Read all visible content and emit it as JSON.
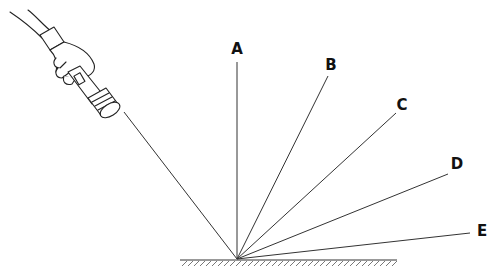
{
  "diagram": {
    "type": "light-reflection",
    "labels": [
      "A",
      "B",
      "C",
      "D",
      "E"
    ],
    "rays": [
      {
        "label": "A",
        "x1": 237,
        "y1": 259,
        "x2": 237,
        "y2": 62,
        "lx": 237,
        "ly": 54
      },
      {
        "label": "B",
        "x1": 237,
        "y1": 259,
        "x2": 328,
        "y2": 76,
        "lx": 331,
        "ly": 70
      },
      {
        "label": "C",
        "x1": 237,
        "y1": 259,
        "x2": 396,
        "y2": 113,
        "lx": 402,
        "ly": 110
      },
      {
        "label": "D",
        "x1": 237,
        "y1": 259,
        "x2": 448,
        "y2": 174,
        "lx": 457,
        "ly": 169
      },
      {
        "label": "E",
        "x1": 237,
        "y1": 259,
        "x2": 470,
        "y2": 233,
        "lx": 482,
        "ly": 236
      }
    ],
    "incident_ray": {
      "x1": 124,
      "y1": 112,
      "x2": 237,
      "y2": 259
    },
    "surface": {
      "x1": 180,
      "x2": 397,
      "y": 260
    }
  },
  "colors": {
    "line": "#333333",
    "label": "#111111",
    "background": "#ffffff"
  }
}
